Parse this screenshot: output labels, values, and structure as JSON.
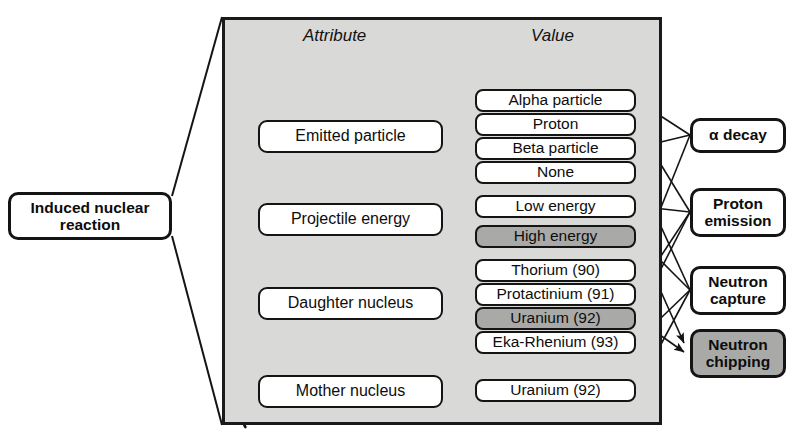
{
  "diagram": {
    "root": {
      "name": "root-node",
      "line1": "Induced nuclear",
      "line2": "reaction"
    },
    "columns": {
      "attribute_header": "Attribute",
      "value_header": "Value"
    },
    "attributes": [
      {
        "id": "emitted-particle",
        "label": "Emitted particle",
        "selected": false,
        "has_incoming_arrow": true
      },
      {
        "id": "projectile-energy",
        "label": "Projectile energy",
        "selected": false,
        "has_incoming_arrow": false
      },
      {
        "id": "daughter-nucleus",
        "label": "Daughter nucleus",
        "selected": false,
        "has_incoming_arrow": true
      },
      {
        "id": "mother-nucleus",
        "label": "Mother nucleus",
        "selected": false,
        "has_incoming_arrow": true
      }
    ],
    "values": [
      {
        "id": "alpha-particle",
        "label": "Alpha particle",
        "attribute": "emitted-particle",
        "selected": false,
        "marked": true
      },
      {
        "id": "proton",
        "label": "Proton",
        "attribute": "emitted-particle",
        "selected": false,
        "marked": false
      },
      {
        "id": "beta-particle",
        "label": "Beta particle",
        "attribute": "emitted-particle",
        "selected": false,
        "marked": false
      },
      {
        "id": "none",
        "label": "None",
        "attribute": "emitted-particle",
        "selected": false,
        "marked": false
      },
      {
        "id": "low-energy",
        "label": "Low energy",
        "attribute": "projectile-energy",
        "selected": false,
        "marked": false
      },
      {
        "id": "high-energy",
        "label": "High energy",
        "attribute": "projectile-energy",
        "selected": true,
        "marked": false
      },
      {
        "id": "thorium-90",
        "label": "Thorium (90)",
        "attribute": "daughter-nucleus",
        "selected": false,
        "marked": true
      },
      {
        "id": "protactinium-91",
        "label": "Protactinium (91)",
        "attribute": "daughter-nucleus",
        "selected": false,
        "marked": false
      },
      {
        "id": "uranium-92-d",
        "label": "Uranium (92)",
        "attribute": "daughter-nucleus",
        "selected": true,
        "marked": false
      },
      {
        "id": "eka-rhenium-93",
        "label": "Eka-Rhenium (93)",
        "attribute": "daughter-nucleus",
        "selected": false,
        "marked": false
      },
      {
        "id": "uranium-92-m",
        "label": "Uranium (92)",
        "attribute": "mother-nucleus",
        "selected": false,
        "marked": false
      }
    ],
    "results": [
      {
        "id": "alpha-decay",
        "line1": "α decay",
        "line2": "",
        "selected": false
      },
      {
        "id": "proton-emission",
        "line1": "Proton",
        "line2": "emission",
        "selected": false
      },
      {
        "id": "neutron-capture",
        "line1": "Neutron",
        "line2": "capture",
        "selected": false
      },
      {
        "id": "neutron-chipping",
        "line1": "Neutron",
        "line2": "chipping",
        "selected": true
      }
    ],
    "colors": {
      "panel_fill": "#d9d9d7",
      "selection_fill": "#a9a9a7",
      "box_fill": "#ffffff",
      "stroke": "#141414",
      "text": "#0d0d0d"
    }
  }
}
